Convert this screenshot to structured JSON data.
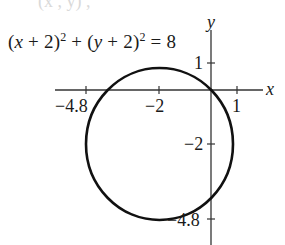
{
  "equation": {
    "lhs_part1_open": "(",
    "var_x": "x",
    "plus_2_a": " + 2)",
    "exp_a": "2",
    "plus": " + (",
    "var_y": "y",
    "plus_2_b": " + 2)",
    "exp_b": "2",
    "equals": " = 8"
  },
  "axes": {
    "x_label": "x",
    "y_label": "y",
    "x_ticks": [
      {
        "value": -4.8,
        "label": "−4.8"
      },
      {
        "value": -2,
        "label": "−2"
      },
      {
        "value": 1,
        "label": "1"
      }
    ],
    "y_ticks": [
      {
        "value": 1,
        "label": "1"
      },
      {
        "value": -2,
        "label": "−2"
      },
      {
        "value": -4.8,
        "label": "−4.8"
      }
    ]
  },
  "circle": {
    "center": [
      -2,
      -2
    ],
    "radius_squared": 8,
    "stroke_color": "#111111"
  },
  "colors": {
    "axis": "#333333",
    "text": "#1a1a1a",
    "background": "#ffffff"
  }
}
